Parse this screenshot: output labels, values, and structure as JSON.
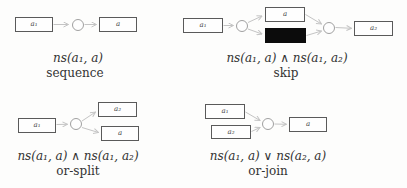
{
  "figure": {
    "background": "#fdfdfc"
  },
  "colors": {
    "background": "#fdfdfc",
    "box_border": "#5a5a5a",
    "box_fill": "#fefefe",
    "box_label": "#444444",
    "place_border": "#a0a0a0",
    "place_fill": "#fefefe",
    "silent_fill": "#0c0c0c",
    "arrow": "#c4c4c4",
    "text": "#333333"
  },
  "patterns": {
    "sequence": {
      "formula": "ns(a₁, a)",
      "caption": "sequence",
      "boxes": {
        "in": "a₁",
        "out": "a"
      }
    },
    "skip": {
      "formula": "ns(a₁, a) ∧ ns(a₁, a₂)",
      "caption": "skip",
      "boxes": {
        "in": "a₁",
        "mid": "a",
        "silent": "",
        "out": "a₂"
      }
    },
    "or_split": {
      "formula": "ns(a₁, a) ∧ ns(a₁, a₂)",
      "caption": "or-split",
      "boxes": {
        "in": "a₁",
        "out_top": "a₂",
        "out_bottom": "a"
      }
    },
    "or_join": {
      "formula": "ns(a₁, a) ∨ ns(a₂, a)",
      "caption": "or-join",
      "boxes": {
        "in_top": "a₁",
        "in_bottom": "a₂",
        "out": "a"
      }
    }
  }
}
